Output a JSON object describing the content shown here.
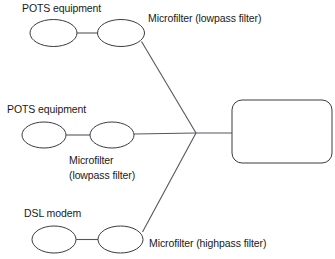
{
  "diagram": {
    "type": "dsl-home-wiring-diagram",
    "background_color": "#ffffff",
    "stroke_color": "#3a3a44",
    "text_color": "#1a1a1a",
    "labels": {
      "pots_equipment_top": "POTS equipment",
      "microfilter_lowpass_top": "Microfilter (lowpass filter)",
      "pots_equipment_middle": "POTS equipment",
      "microfilter_middle_line1": "Microfilter",
      "microfilter_middle_line2": "(lowpass filter)",
      "dsl_modem": "DSL modem",
      "microfilter_highpass": "Microfilter (highpass filter)",
      "splitter_box": ""
    },
    "nodes": [
      {
        "name": "pots-equipment-top",
        "shape": "ellipse",
        "cx": 53.5,
        "cy": 33,
        "rx": 23.5,
        "ry": 13.5
      },
      {
        "name": "microfilter-top",
        "shape": "ellipse",
        "cx": 121,
        "cy": 33,
        "rx": 23.5,
        "ry": 13.5
      },
      {
        "name": "pots-equipment-middle",
        "shape": "ellipse",
        "cx": 44,
        "cy": 135,
        "rx": 22,
        "ry": 13
      },
      {
        "name": "microfilter-middle",
        "shape": "ellipse",
        "cx": 112,
        "cy": 135,
        "rx": 22,
        "ry": 13
      },
      {
        "name": "dsl-modem",
        "shape": "ellipse",
        "cx": 54,
        "cy": 239.5,
        "rx": 22,
        "ry": 13.5
      },
      {
        "name": "microfilter-highpass",
        "shape": "ellipse",
        "cx": 120.5,
        "cy": 239.5,
        "rx": 22.5,
        "ry": 13.5
      },
      {
        "name": "network-interface-box",
        "shape": "rounded-rect",
        "x": 232,
        "y": 100,
        "width": 100,
        "height": 63,
        "radius": 10
      }
    ],
    "edges": [
      {
        "name": "edge-pots-top-to-filter-top",
        "x1": 77,
        "y1": 33,
        "x2": 97,
        "y2": 33
      },
      {
        "name": "edge-filter-top-to-junction",
        "x1": 142,
        "y1": 41,
        "x2": 196,
        "y2": 133
      },
      {
        "name": "edge-pots-middle-to-filter-middle",
        "x1": 66,
        "y1": 135,
        "x2": 90,
        "y2": 135
      },
      {
        "name": "edge-filter-middle-to-junction",
        "x1": 134,
        "y1": 134,
        "x2": 196,
        "y2": 133
      },
      {
        "name": "edge-dsl-modem-to-filter-highpass",
        "x1": 76,
        "y1": 239.5,
        "x2": 98,
        "y2": 239.5
      },
      {
        "name": "edge-filter-highpass-to-junction",
        "x1": 143,
        "y1": 232,
        "x2": 196,
        "y2": 133
      },
      {
        "name": "edge-junction-to-box",
        "x1": 196,
        "y1": 133,
        "x2": 232,
        "y2": 133
      }
    ]
  }
}
